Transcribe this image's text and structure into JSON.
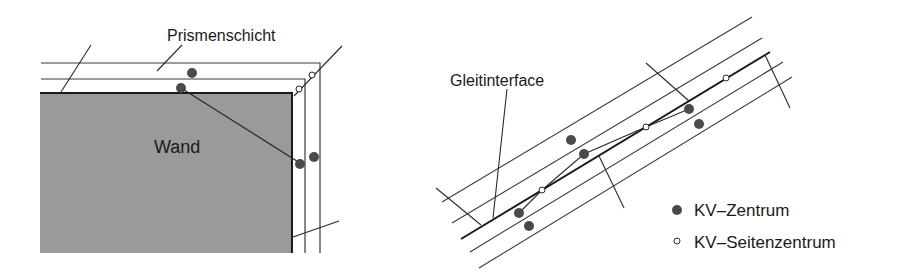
{
  "left_panel": {
    "labels": {
      "layer": "Prismenschicht",
      "wall": "Wand"
    },
    "colors": {
      "wall_fill": "#9a9a9a",
      "line": "#2a2a2a",
      "cv_center": "#4a4a4a",
      "cv_face_center": "#ffffff"
    }
  },
  "right_panel": {
    "labels": {
      "interface": "Gleitinterface"
    }
  },
  "legend": {
    "items": [
      {
        "marker": "filled-circle",
        "label": "KV–Zentrum"
      },
      {
        "marker": "open-circle",
        "label": "KV–Seitenzentrum"
      }
    ]
  }
}
